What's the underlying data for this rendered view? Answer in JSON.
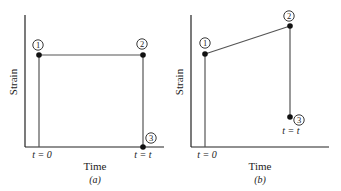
{
  "panels": [
    {
      "id": "a",
      "caption": "(a)",
      "xlabel": "Time",
      "ylabel": "Strain",
      "tick_labels": {
        "start": "t = 0",
        "end": "t = t"
      },
      "points": [
        {
          "label": "1",
          "x": 39,
          "y": 55
        },
        {
          "label": "2",
          "x": 143,
          "y": 55
        },
        {
          "label": "3",
          "x": 143,
          "y": 147
        }
      ]
    },
    {
      "id": "b",
      "caption": "(b)",
      "xlabel": "Time",
      "ylabel": "Strain",
      "tick_labels": {
        "start": "t = 0",
        "end": "t = t"
      },
      "points": [
        {
          "label": "1",
          "x": 205,
          "y": 54
        },
        {
          "label": "2",
          "x": 290,
          "y": 26
        },
        {
          "label": "3",
          "x": 290,
          "y": 117
        }
      ]
    }
  ]
}
